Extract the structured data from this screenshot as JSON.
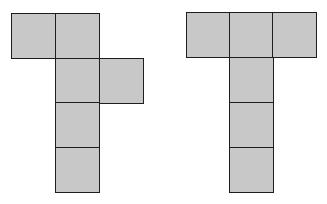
{
  "diagram": {
    "fill_color": "#c8c8c8",
    "border_color": "#1e1e1e",
    "nets": [
      {
        "name": "left-net",
        "squares": [
          {
            "x": 11,
            "y": 13
          },
          {
            "x": 55,
            "y": 13
          },
          {
            "x": 55,
            "y": 58
          },
          {
            "x": 99,
            "y": 58
          },
          {
            "x": 55,
            "y": 102
          },
          {
            "x": 55,
            "y": 147
          }
        ]
      },
      {
        "name": "right-net",
        "squares": [
          {
            "x": 186,
            "y": 12
          },
          {
            "x": 229,
            "y": 12
          },
          {
            "x": 272,
            "y": 12
          },
          {
            "x": 229,
            "y": 57
          },
          {
            "x": 229,
            "y": 102
          },
          {
            "x": 229,
            "y": 147
          }
        ]
      }
    ]
  }
}
